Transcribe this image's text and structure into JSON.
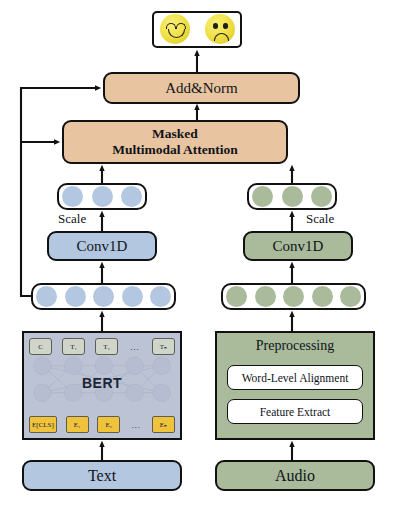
{
  "diagram": {
    "colors": {
      "tan": "#e8c4a0",
      "blue": "#b4c7e0",
      "green": "#a9bb9b",
      "bert_fill": "#bcc3d4",
      "embedding_yellow": "#f0c33c",
      "output_token": "#cfd6c9",
      "emoji_yellow": "#f2e34e",
      "stroke": "#111111"
    },
    "output": {
      "emojis": [
        {
          "name": "happy-face",
          "sentiment": "positive"
        },
        {
          "name": "sad-face",
          "sentiment": "negative"
        }
      ]
    },
    "blocks": {
      "add_norm": "Add&Norm",
      "attention_line1": "Masked",
      "attention_line2": "Multimodal Attention",
      "conv_text": "Conv1D",
      "conv_audio": "Conv1D",
      "scale_text": "Scale",
      "scale_audio": "Scale",
      "bert": "BERT",
      "preprocessing": "Preprocessing",
      "word_level_alignment": "Word-Level Alignment",
      "feature_extract": "Feature Extract",
      "text_input": "Text",
      "audio_input": "Audio"
    },
    "bert_tokens": {
      "outputs": [
        "C",
        "T₁",
        "T₂",
        "…",
        "Tₙ"
      ],
      "embeddings": [
        "E[CLS]",
        "E₁",
        "E₂",
        "…",
        "Eₙ"
      ]
    },
    "sequences": {
      "text_top_count": 3,
      "text_bottom_count": 5,
      "audio_top_count": 3,
      "audio_bottom_count": 5
    }
  }
}
